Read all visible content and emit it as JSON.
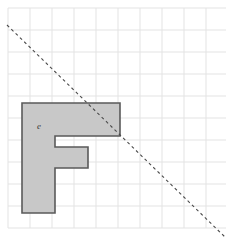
{
  "figure": {
    "title": "",
    "background_color": "#ffffff",
    "width": 226,
    "height": 237
  },
  "grid": {
    "name": "square-grid",
    "line_color": "#e3e3e3",
    "major_line_color": "#dcdcdc",
    "cell_size": 22,
    "origin_x": 8,
    "origin_y": 8,
    "columns": 10,
    "rows": 10,
    "right_edge": 228,
    "bottom_edge": 228,
    "visible": true
  },
  "polygon": {
    "name": "letter-f-polygon",
    "shape": "F",
    "fill_color": "#c8c8c8",
    "stroke_color": "#5a5a5a",
    "stroke_width": 1.6,
    "points": "22,103 120,103 120,136 55,136 55,147 88,147 88,168 55,168 55,213 22,213",
    "vertices": [
      [
        22,
        103
      ],
      [
        120,
        103
      ],
      [
        120,
        136
      ],
      [
        55,
        136
      ],
      [
        55,
        147
      ],
      [
        88,
        147
      ],
      [
        88,
        168
      ],
      [
        55,
        168
      ],
      [
        55,
        213
      ],
      [
        22,
        213
      ]
    ]
  },
  "dashed_line": {
    "name": "diagonal-dashed-line",
    "color": "#4a4a4a",
    "stroke_width": 1.1,
    "dash_pattern": "3,3",
    "x1": 7,
    "y1": 25,
    "x2": 226,
    "y2": 238,
    "slope": -0.97
  },
  "labels": [
    {
      "name": "label-e",
      "text": "e",
      "x": 37,
      "y": 129,
      "style": "italic",
      "color": "#3a3a3a"
    }
  ]
}
